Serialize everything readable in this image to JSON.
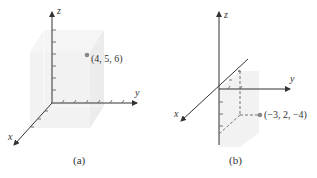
{
  "figure": {
    "panels": [
      {
        "id": "a",
        "caption": "(a)",
        "axes": {
          "x": "x",
          "y": "y",
          "z": "z"
        },
        "point": {
          "label": "(4, 5, 6)",
          "coords": [
            4,
            5,
            6
          ]
        }
      },
      {
        "id": "b",
        "caption": "(b)",
        "axes": {
          "x": "x",
          "y": "y",
          "z": "z"
        },
        "point": {
          "label": "(−3, 2, −4)",
          "coords": [
            -3,
            2,
            -4
          ]
        }
      }
    ],
    "colors": {
      "axis": "#333333",
      "box": "#e6e6e6",
      "point": "#888888"
    }
  }
}
